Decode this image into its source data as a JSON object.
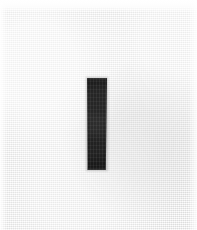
{
  "image": {
    "width": 197,
    "height": 230,
    "background_color": "#f1f1f1",
    "background_description": "light gray woven paper texture",
    "top_band_color": "#ffffff",
    "edge_highlight_color": "#ffffff"
  },
  "mark": {
    "name": "vertical-bar",
    "shape": "rectangle",
    "color": "#111111",
    "x": 87,
    "y": 78,
    "width": 20,
    "height": 92,
    "orientation": "vertical"
  },
  "labels": {
    "figure_alt": "dark vertical bar on light textured background"
  }
}
